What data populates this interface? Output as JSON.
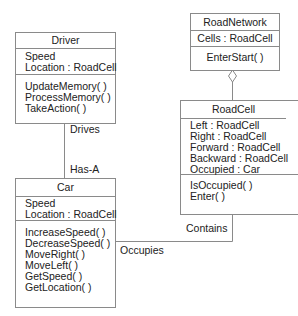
{
  "diagram": {
    "type": "UML class diagram",
    "classes": [
      {
        "id": "driver",
        "name": "Driver",
        "attributes": [
          "Speed",
          "Location : RoadCell"
        ],
        "methods": [
          "UpdateMemory( )",
          "ProcessMemory( )",
          "TakeAction( )"
        ]
      },
      {
        "id": "car",
        "name": "Car",
        "attributes": [
          "Speed",
          "Location : RoadCell"
        ],
        "methods": [
          "IncreaseSpeed( )",
          "DecreaseSpeed( )",
          "MoveRight( )",
          "MoveLeft( )",
          "GetSpeed( )",
          "GetLocation( )"
        ]
      },
      {
        "id": "roadnetwork",
        "name": "RoadNetwork",
        "attributes": [
          "Cells : RoadCell"
        ],
        "methods": [
          "EnterStart( )"
        ]
      },
      {
        "id": "roadcell",
        "name": "RoadCell",
        "attributes": [
          "Left : RoadCell",
          "Right : RoadCell",
          "Forward : RoadCell",
          "Backward : RoadCell",
          "Occupied : Car"
        ],
        "methods": [
          "IsOccupied( )",
          "Enter( )"
        ]
      }
    ],
    "relationships": [
      {
        "from": "Driver",
        "to": "Car",
        "type": "association",
        "labels": [
          "Drives",
          "Has-A"
        ]
      },
      {
        "from": "RoadNetwork",
        "to": "RoadCell",
        "type": "aggregation",
        "labels": []
      },
      {
        "from": "RoadCell",
        "to": "Car",
        "type": "association",
        "labels": [
          "Contains",
          "Occupies"
        ]
      }
    ]
  }
}
